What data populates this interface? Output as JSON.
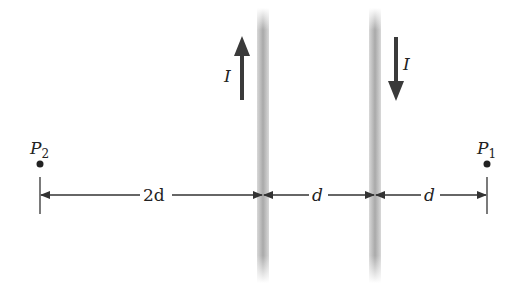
{
  "diagram": {
    "wires": [
      {
        "id": "wire-1",
        "x": 263,
        "current_label": "I",
        "current_direction": "up"
      },
      {
        "id": "wire-2",
        "x": 375,
        "current_label": "I",
        "current_direction": "down"
      }
    ],
    "points": [
      {
        "id": "P2",
        "label": "P",
        "subscript": "2",
        "x": 40
      },
      {
        "id": "P1",
        "label": "P",
        "subscript": "1",
        "x": 487
      }
    ],
    "dimensions": [
      {
        "label": "2d",
        "from": "P2",
        "to": "wire-1"
      },
      {
        "label": "d",
        "from": "wire-1",
        "to": "wire-2"
      },
      {
        "label": "d",
        "from": "wire-2",
        "to": "P1"
      }
    ],
    "colors": {
      "wire": "#b5b5b5",
      "ink": "#333333",
      "arrow": "#3a3a3a"
    }
  }
}
